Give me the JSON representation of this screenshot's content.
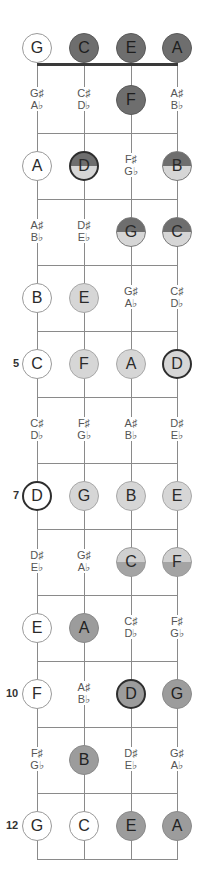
{
  "colors": {
    "line": "#8a8a8a",
    "nut": "#3a3a3a",
    "white": "#ffffff",
    "dark": "#6e6e6e",
    "light": "#d6d6d6",
    "medium": "#9c9c9c",
    "root_border": "#2e2e2e"
  },
  "strings": [
    "G",
    "C",
    "E",
    "A"
  ],
  "fret_markers": [
    {
      "fret": 5,
      "label": "5"
    },
    {
      "fret": 7,
      "label": "7"
    },
    {
      "fret": 10,
      "label": "10"
    },
    {
      "fret": 12,
      "label": "12"
    }
  ],
  "frets": [
    {
      "fret": 0,
      "cells": [
        {
          "type": "note",
          "label": "G",
          "style": "white"
        },
        {
          "type": "note",
          "label": "C",
          "style": "dark"
        },
        {
          "type": "note",
          "label": "E",
          "style": "dark"
        },
        {
          "type": "note",
          "label": "A",
          "style": "dark"
        }
      ]
    },
    {
      "fret": 1,
      "cells": [
        {
          "type": "acc",
          "sharp": "G♯",
          "flat": "A♭"
        },
        {
          "type": "acc",
          "sharp": "C♯",
          "flat": "D♭"
        },
        {
          "type": "note",
          "label": "F",
          "style": "dark"
        },
        {
          "type": "acc",
          "sharp": "A♯",
          "flat": "B♭"
        }
      ]
    },
    {
      "fret": 2,
      "cells": [
        {
          "type": "note",
          "label": "A",
          "style": "white"
        },
        {
          "type": "note",
          "label": "D",
          "style": "half-dark-light",
          "root": true
        },
        {
          "type": "acc",
          "sharp": "F♯",
          "flat": "G♭"
        },
        {
          "type": "note",
          "label": "B",
          "style": "half-dark-light"
        }
      ]
    },
    {
      "fret": 3,
      "cells": [
        {
          "type": "acc",
          "sharp": "A♯",
          "flat": "B♭"
        },
        {
          "type": "acc",
          "sharp": "D♯",
          "flat": "E♭"
        },
        {
          "type": "note",
          "label": "G",
          "style": "half-dark-light"
        },
        {
          "type": "note",
          "label": "C",
          "style": "half-dark-light"
        }
      ]
    },
    {
      "fret": 4,
      "cells": [
        {
          "type": "note",
          "label": "B",
          "style": "white"
        },
        {
          "type": "note",
          "label": "E",
          "style": "light"
        },
        {
          "type": "acc",
          "sharp": "G♯",
          "flat": "A♭"
        },
        {
          "type": "acc",
          "sharp": "C♯",
          "flat": "D♭"
        }
      ]
    },
    {
      "fret": 5,
      "cells": [
        {
          "type": "note",
          "label": "C",
          "style": "white"
        },
        {
          "type": "note",
          "label": "F",
          "style": "light"
        },
        {
          "type": "note",
          "label": "A",
          "style": "light"
        },
        {
          "type": "note",
          "label": "D",
          "style": "light",
          "root": true
        }
      ]
    },
    {
      "fret": 6,
      "cells": [
        {
          "type": "acc",
          "sharp": "C♯",
          "flat": "D♭"
        },
        {
          "type": "acc",
          "sharp": "F♯",
          "flat": "G♭"
        },
        {
          "type": "acc",
          "sharp": "A♯",
          "flat": "B♭"
        },
        {
          "type": "acc",
          "sharp": "D♯",
          "flat": "E♭"
        }
      ]
    },
    {
      "fret": 7,
      "cells": [
        {
          "type": "note",
          "label": "D",
          "style": "white",
          "root": true
        },
        {
          "type": "note",
          "label": "G",
          "style": "light"
        },
        {
          "type": "note",
          "label": "B",
          "style": "light"
        },
        {
          "type": "note",
          "label": "E",
          "style": "light"
        }
      ]
    },
    {
      "fret": 8,
      "cells": [
        {
          "type": "acc",
          "sharp": "D♯",
          "flat": "E♭"
        },
        {
          "type": "acc",
          "sharp": "G♯",
          "flat": "A♭"
        },
        {
          "type": "note",
          "label": "C",
          "style": "half-light-medium"
        },
        {
          "type": "note",
          "label": "F",
          "style": "half-light-medium"
        }
      ]
    },
    {
      "fret": 9,
      "cells": [
        {
          "type": "note",
          "label": "E",
          "style": "white"
        },
        {
          "type": "note",
          "label": "A",
          "style": "medium"
        },
        {
          "type": "acc",
          "sharp": "C♯",
          "flat": "D♭"
        },
        {
          "type": "acc",
          "sharp": "F♯",
          "flat": "G♭"
        }
      ]
    },
    {
      "fret": 10,
      "cells": [
        {
          "type": "note",
          "label": "F",
          "style": "white"
        },
        {
          "type": "acc",
          "sharp": "A♯",
          "flat": "B♭"
        },
        {
          "type": "note",
          "label": "D",
          "style": "medium",
          "root": true
        },
        {
          "type": "note",
          "label": "G",
          "style": "medium"
        }
      ]
    },
    {
      "fret": 11,
      "cells": [
        {
          "type": "acc",
          "sharp": "F♯",
          "flat": "G♭"
        },
        {
          "type": "note",
          "label": "B",
          "style": "medium"
        },
        {
          "type": "acc",
          "sharp": "D♯",
          "flat": "E♭"
        },
        {
          "type": "acc",
          "sharp": "G♯",
          "flat": "A♭"
        }
      ]
    },
    {
      "fret": 12,
      "cells": [
        {
          "type": "note",
          "label": "G",
          "style": "white"
        },
        {
          "type": "note",
          "label": "C",
          "style": "white"
        },
        {
          "type": "note",
          "label": "E",
          "style": "medium"
        },
        {
          "type": "note",
          "label": "A",
          "style": "medium"
        }
      ]
    }
  ]
}
